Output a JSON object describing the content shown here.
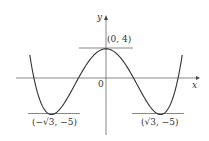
{
  "chart_data": {
    "type": "line",
    "title": "",
    "function": "y = x^4 - 6x^2 + 4",
    "xlabel": "x",
    "ylabel": "y",
    "origin_label": "0",
    "x": [
      -2.45,
      -2.0,
      -1.732,
      -1.5,
      -1.0,
      -0.5,
      0,
      0.5,
      1.0,
      1.5,
      1.732,
      2.0,
      2.45
    ],
    "values": [
      4.02,
      -4.0,
      -5.0,
      -4.44,
      -1.0,
      2.56,
      4.0,
      2.56,
      -1.0,
      -4.44,
      -5.0,
      -4.0,
      4.02
    ],
    "annotations": [
      {
        "label": "(0, 4)",
        "x": 0,
        "y": 4,
        "note": "local maximum with horizontal tangent"
      },
      {
        "label": "(−√3, −5)",
        "x": -1.732,
        "y": -5,
        "note": "local minimum with horizontal tangent"
      },
      {
        "label": "(√3, −5)",
        "x": 1.732,
        "y": -5,
        "note": "local minimum with horizontal tangent"
      }
    ],
    "grid": false,
    "legend": null
  },
  "labels": {
    "y_axis": "y",
    "x_axis": "x",
    "origin": "0",
    "max_point": "(0, 4)",
    "min_left": "(−√3, −5)",
    "min_right": "(√3, −5)"
  }
}
